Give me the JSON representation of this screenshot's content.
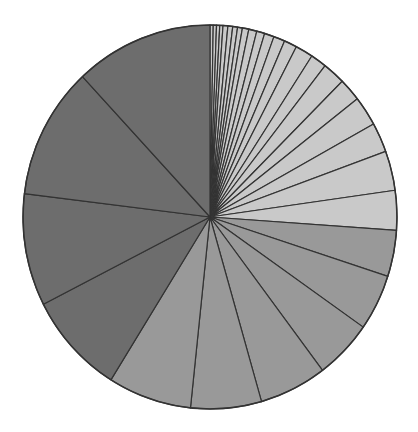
{
  "chart_data": {
    "type": "pie",
    "title": "",
    "xlabel": "",
    "ylabel": "",
    "legend": [],
    "start_angle_deg": 0,
    "direction": "clockwise",
    "center": [
      210,
      217
    ],
    "radius_x": 187,
    "radius_y": 192,
    "colors": {
      "light": "#c9c9c9",
      "medium": "#999999",
      "dark": "#6d6d6d",
      "outline": "#333333",
      "background": "#ffffff"
    },
    "slices": [
      {
        "value": 1,
        "color": "light"
      },
      {
        "value": 1,
        "color": "light"
      },
      {
        "value": 1,
        "color": "light"
      },
      {
        "value": 1,
        "color": "light"
      },
      {
        "value": 1.5,
        "color": "light"
      },
      {
        "value": 1.5,
        "color": "light"
      },
      {
        "value": 1.5,
        "color": "light"
      },
      {
        "value": 1.5,
        "color": "light"
      },
      {
        "value": 2,
        "color": "light"
      },
      {
        "value": 2.5,
        "color": "light"
      },
      {
        "value": 2.5,
        "color": "light"
      },
      {
        "value": 3,
        "color": "light"
      },
      {
        "value": 3.5,
        "color": "light"
      },
      {
        "value": 4,
        "color": "light"
      },
      {
        "value": 5.5,
        "color": "light"
      },
      {
        "value": 5,
        "color": "light"
      },
      {
        "value": 7,
        "color": "light"
      },
      {
        "value": 7,
        "color": "light"
      },
      {
        "value": 9,
        "color": "light"
      },
      {
        "value": 9,
        "color": "light"
      },
      {
        "value": 12,
        "color": "light"
      },
      {
        "value": 12,
        "color": "light"
      },
      {
        "value": 14,
        "color": "medium"
      },
      {
        "value": 17,
        "color": "medium"
      },
      {
        "value": 18,
        "color": "medium"
      },
      {
        "value": 21,
        "color": "medium"
      },
      {
        "value": 22,
        "color": "medium"
      },
      {
        "value": 26,
        "color": "medium"
      },
      {
        "value": 31,
        "color": "dark"
      },
      {
        "value": 34,
        "color": "dark"
      },
      {
        "value": 40,
        "color": "dark"
      },
      {
        "value": 43,
        "color": "dark"
      }
    ],
    "values": [
      1,
      1,
      1,
      1,
      1.5,
      1.5,
      1.5,
      1.5,
      2,
      2.5,
      2.5,
      3,
      3.5,
      4,
      5.5,
      5,
      7,
      7,
      9,
      9,
      12,
      12,
      14,
      17,
      18,
      21,
      22,
      26,
      31,
      34,
      40,
      43
    ],
    "total": 360
  }
}
